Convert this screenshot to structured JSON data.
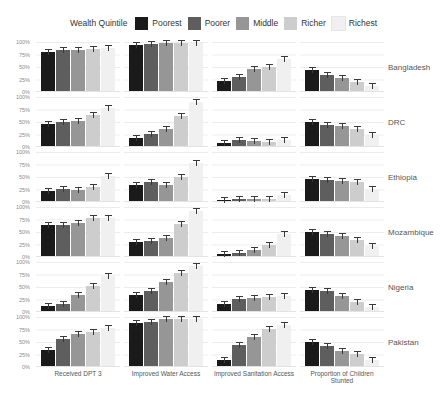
{
  "legend": {
    "title": "Wealth Quintile",
    "items": [
      {
        "label": "Poorest",
        "color": "#1a1a1a"
      },
      {
        "label": "Poorer",
        "color": "#5e5e5e"
      },
      {
        "label": "Middle",
        "color": "#969696"
      },
      {
        "label": "Richer",
        "color": "#cdcdcd"
      },
      {
        "label": "Richest",
        "color": "#f0f0f0"
      }
    ]
  },
  "chart_data": {
    "type": "bar",
    "title": "",
    "facet_columns": [
      "Received DPT 3",
      "Improved Water Access",
      "Improved Sanitation Access",
      "Proportion of Children Stunted"
    ],
    "facet_rows": [
      "Bangladesh",
      "DRC",
      "Ethiopia",
      "Mozambique",
      "Nigeria",
      "Pakistan"
    ],
    "series_labels": [
      "Poorest",
      "Poorer",
      "Middle",
      "Richer",
      "Richest"
    ],
    "series_colors": [
      "#1a1a1a",
      "#5e5e5e",
      "#969696",
      "#cdcdcd",
      "#f0f0f0"
    ],
    "y_ticks": [
      "100%",
      "75%",
      "50%",
      "25%",
      "0%"
    ],
    "ylim": [
      0,
      100
    ],
    "grid": "horizontal major lines at 25% intervals",
    "legend_position": "top",
    "error_bars": "approx ±3 percentage points shown on each bar",
    "values_unit": "percent",
    "values": {
      "Bangladesh": [
        [
          79,
          83,
          83,
          85,
          88
        ],
        [
          93,
          96,
          97,
          97,
          97
        ],
        [
          20,
          28,
          45,
          48,
          65
        ],
        [
          42,
          32,
          26,
          18,
          10
        ]
      ],
      "DRC": [
        [
          45,
          50,
          52,
          63,
          77
        ],
        [
          17,
          25,
          35,
          62,
          90
        ],
        [
          7,
          12,
          11,
          8,
          13
        ],
        [
          48,
          43,
          40,
          35,
          23
        ]
      ],
      "Ethiopia": [
        [
          20,
          24,
          23,
          28,
          52
        ],
        [
          32,
          38,
          33,
          48,
          78
        ],
        [
          3,
          5,
          4,
          5,
          12
        ],
        [
          45,
          42,
          40,
          38,
          25
        ]
      ],
      "Mozambique": [
        [
          63,
          63,
          67,
          77,
          78
        ],
        [
          28,
          30,
          37,
          65,
          92
        ],
        [
          4,
          7,
          13,
          22,
          45
        ],
        [
          48,
          45,
          40,
          32,
          20
        ]
      ],
      "Nigeria": [
        [
          10,
          15,
          33,
          52,
          72
        ],
        [
          33,
          40,
          60,
          78,
          92
        ],
        [
          15,
          25,
          27,
          28,
          30
        ],
        [
          42,
          40,
          31,
          18,
          9
        ]
      ],
      "Pakistan": [
        [
          33,
          55,
          65,
          70,
          77
        ],
        [
          87,
          90,
          95,
          95,
          95
        ],
        [
          13,
          42,
          60,
          75,
          83
        ],
        [
          50,
          40,
          30,
          25,
          12
        ]
      ]
    }
  }
}
